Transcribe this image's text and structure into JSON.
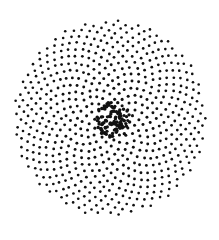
{
  "image": {
    "description": "Stippled dot pattern (phyllotaxis spiral) on white background",
    "width": 219,
    "height": 223,
    "background": "#ffffff",
    "dot_color": "#111111"
  },
  "pattern": {
    "type": "phyllotaxis",
    "center": [
      110,
      118
    ],
    "outer_radius": 96,
    "dot_count": 620,
    "golden_angle_deg": 137.508,
    "outer_dot_radius": 1.3,
    "inner_dot_radius": 1.6,
    "center_cluster": {
      "center": [
        113,
        120
      ],
      "radius": 18,
      "dot_count": 90,
      "dot_radius": 1.7
    }
  }
}
